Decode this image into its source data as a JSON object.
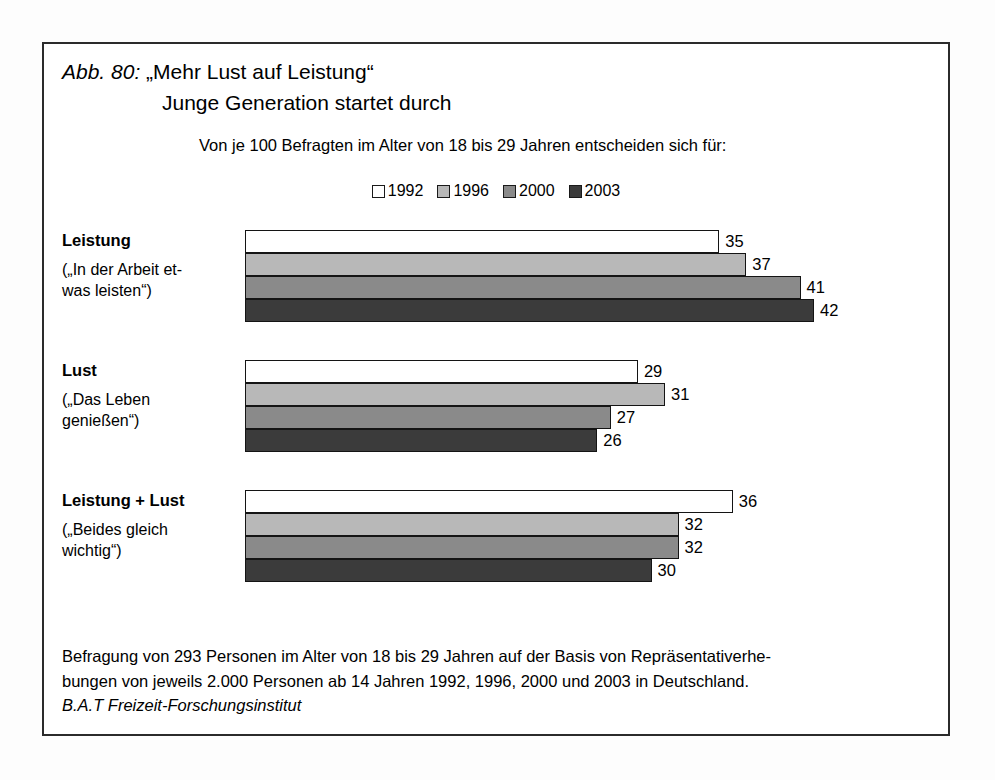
{
  "figure": {
    "label": "Abb. 80:",
    "title_line1": "„Mehr Lust auf Leistung“",
    "title_line2": "Junge Generation startet durch",
    "subtitle": "Von je 100 Befragten im Alter von 18 bis 29 Jahren entscheiden sich für:",
    "footnote_line1": "Befragung von 293 Personen im Alter von 18 bis 29 Jahren auf der Basis von Repräsentativerhe-",
    "footnote_line2": "bungen von jeweils 2.000 Personen ab 14 Jahren 1992, 1996, 2000 und 2003 in Deutschland.",
    "source": "B.A.T Freizeit-Forschungsinstitut"
  },
  "legend": {
    "items": [
      {
        "label": "1992",
        "color": "#ffffff"
      },
      {
        "label": "1996",
        "color": "#b8b8b8"
      },
      {
        "label": "2000",
        "color": "#8a8a8a"
      },
      {
        "label": "2003",
        "color": "#3b3b3b"
      }
    ]
  },
  "groups": [
    {
      "title": "Leistung",
      "sub": "(„In der Arbeit et-\nwas leisten“)"
    },
    {
      "title": "Lust",
      "sub": "(„Das Leben\ngenießen“)"
    },
    {
      "title": "Leistung + Lust",
      "sub": "(„Beides gleich\nwichtig“)"
    }
  ],
  "chart_data": {
    "type": "bar",
    "orientation": "horizontal",
    "subtitle": "Von je 100 Befragten im Alter von 18 bis 29 Jahren entscheiden sich für:",
    "xlabel": "",
    "ylabel": "",
    "xlim": [
      0,
      42
    ],
    "grid": false,
    "legend_position": "top-center",
    "categories": [
      "Leistung",
      "Lust",
      "Leistung + Lust"
    ],
    "series": [
      {
        "name": "1992",
        "color": "#ffffff",
        "values": [
          35,
          29,
          36
        ]
      },
      {
        "name": "1996",
        "color": "#b8b8b8",
        "values": [
          37,
          31,
          32
        ]
      },
      {
        "name": "2000",
        "color": "#8a8a8a",
        "values": [
          41,
          27,
          32
        ]
      },
      {
        "name": "2003",
        "color": "#3b3b3b",
        "values": [
          42,
          26,
          30
        ]
      }
    ],
    "annotations": [
      "Befragung von 293 Personen im Alter von 18 bis 29 Jahren auf der Basis von Repräsentativerhebungen von jeweils 2.000 Personen ab 14 Jahren 1992, 1996, 2000 und 2003 in Deutschland.",
      "B.A.T Freizeit-Forschungsinstitut"
    ]
  },
  "render": {
    "px_per_unit": 13.55,
    "group_tops": [
      186,
      316,
      446
    ]
  }
}
